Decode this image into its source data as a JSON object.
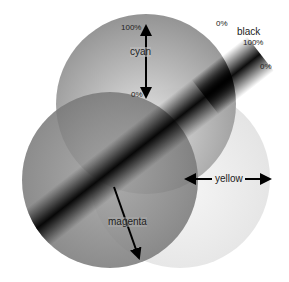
{
  "diagram": {
    "type": "cmyk-color-separation",
    "channels": [
      {
        "name": "cyan",
        "label": "cyan",
        "scale_start": "100%",
        "scale_end": "0%",
        "direction": "vertical"
      },
      {
        "name": "magenta",
        "label": "magenta",
        "direction": "diagonal-down"
      },
      {
        "name": "yellow",
        "label": "yellow",
        "direction": "horizontal"
      },
      {
        "name": "black",
        "label": "black",
        "scale_start": "0%",
        "scale_mid": "100%",
        "scale_end": "0%",
        "direction": "diagonal-band"
      }
    ]
  },
  "labels": {
    "cyan": "cyan",
    "cyan_top": "100%",
    "cyan_bottom": "0%",
    "black": "black",
    "black_left": "0%",
    "black_mid": "100%",
    "black_right": "0%",
    "yellow": "yellow",
    "magenta": "magenta"
  },
  "colors": {
    "background": "#ffffff",
    "cyan_circle": "#8a8a8a",
    "magenta_circle": "#6e6e6e",
    "yellow_circle": "#e6e6e6",
    "black_band": "#000000",
    "arrow": "#000000",
    "text": "#222222"
  }
}
